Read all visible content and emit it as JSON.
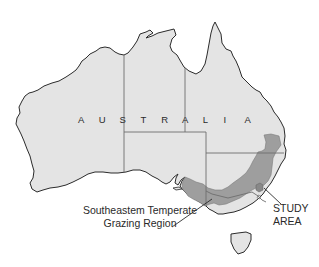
{
  "map": {
    "title": "Map of Australia showing study area",
    "country_label": "AUSTRALIA",
    "country_letters": [
      "A",
      "U",
      "S",
      "T",
      "R",
      "A",
      "L",
      "I",
      "A"
    ],
    "labels": {
      "region_line1": "Southeastem Temperate",
      "region_line2": "Grazing Region",
      "study_line1": "STUDY",
      "study_line2": "AREA"
    },
    "legend_features": [
      {
        "name": "Southeastern Temperate Grazing Region",
        "color": "#9c9c9c"
      },
      {
        "name": "Study Area",
        "color": "#8a8a8a"
      }
    ],
    "colors": {
      "land": "#e4e4e4",
      "coastline": "#2b2b2b",
      "state_border": "#6e6e6e",
      "grazing_region": "#9e9e9e",
      "study_area": "#888888",
      "background": "#ffffff"
    }
  }
}
